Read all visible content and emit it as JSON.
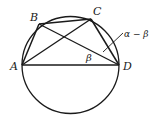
{
  "diagram": {
    "type": "inscribed-quadrilateral",
    "stroke_color": "#1a1a1a",
    "background": "#ffffff",
    "circle": {
      "cx": 70.5,
      "cy": 65,
      "r": 48.5
    },
    "points": {
      "A": {
        "x": 22,
        "y": 65,
        "label": "A"
      },
      "B": {
        "x": 39,
        "y": 24,
        "label": "B"
      },
      "C": {
        "x": 91,
        "y": 19,
        "label": "C"
      },
      "D": {
        "x": 119,
        "y": 65,
        "label": "D"
      }
    },
    "segments": [
      "AB",
      "BC",
      "CD",
      "AD",
      "AC",
      "BD"
    ],
    "labels": {
      "A": "A",
      "B": "B",
      "C": "C",
      "D": "D",
      "beta": "β",
      "alpha_minus_beta": "α − β"
    }
  }
}
